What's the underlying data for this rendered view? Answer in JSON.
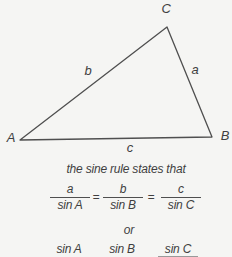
{
  "figure": {
    "triangle": {
      "vertex_labels": {
        "A": "A",
        "B": "B",
        "C": "C"
      },
      "side_labels": {
        "a": "a",
        "b": "b",
        "c": "c"
      }
    },
    "caption": "the sine rule states that",
    "sine_rule": {
      "fractions": [
        {
          "numerator": "a",
          "denominator": "sin A"
        },
        {
          "numerator": "b",
          "denominator": "sin B"
        },
        {
          "numerator": "c",
          "denominator": "sin C"
        }
      ],
      "equals_sign": "=",
      "or_label": "or",
      "alternate_row": [
        "sin A",
        "sin B",
        "sin C"
      ]
    },
    "colors": {
      "ink": "#3f3f3f",
      "line": "#4f4f4f",
      "background": "#f5f5f3"
    }
  }
}
